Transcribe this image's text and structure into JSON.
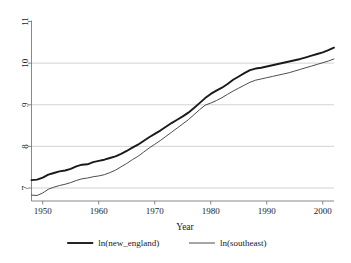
{
  "chart_data": {
    "type": "line",
    "title": "",
    "xlabel": "Year",
    "ylabel": "",
    "xlim": [
      1948,
      2002
    ],
    "ylim": [
      6.62,
      11.0
    ],
    "grid": true,
    "grid_axis": "y",
    "legend_position": "bottom",
    "xticks": [
      1950,
      1960,
      1970,
      1980,
      1990,
      2000
    ],
    "xtick_labels": [
      "1950",
      "1960",
      "1970",
      "1980",
      "1990",
      "2000"
    ],
    "yticks": [
      7,
      8,
      9,
      10,
      11
    ],
    "ytick_labels": [
      "7",
      "8",
      "9",
      "10",
      "11"
    ],
    "x": [
      1948,
      1949,
      1950,
      1951,
      1952,
      1953,
      1954,
      1955,
      1956,
      1957,
      1958,
      1959,
      1960,
      1961,
      1962,
      1963,
      1964,
      1965,
      1966,
      1967,
      1968,
      1969,
      1970,
      1971,
      1972,
      1973,
      1974,
      1975,
      1976,
      1977,
      1978,
      1979,
      1980,
      1981,
      1982,
      1983,
      1984,
      1985,
      1986,
      1987,
      1988,
      1989,
      1990,
      1991,
      1992,
      1993,
      1994,
      1995,
      1996,
      1997,
      1998,
      1999,
      2000,
      2001,
      2002
    ],
    "series": [
      {
        "name": "ln(new_england)",
        "color": "#1a1a1a",
        "width": 1.9,
        "values": [
          7.19,
          7.2,
          7.25,
          7.32,
          7.36,
          7.4,
          7.42,
          7.46,
          7.52,
          7.56,
          7.57,
          7.62,
          7.65,
          7.68,
          7.72,
          7.76,
          7.82,
          7.89,
          7.97,
          8.04,
          8.13,
          8.22,
          8.3,
          8.38,
          8.47,
          8.56,
          8.64,
          8.72,
          8.81,
          8.92,
          9.04,
          9.16,
          9.26,
          9.34,
          9.41,
          9.5,
          9.6,
          9.68,
          9.76,
          9.83,
          9.87,
          9.89,
          9.92,
          9.95,
          9.98,
          10.01,
          10.04,
          10.07,
          10.1,
          10.14,
          10.18,
          10.22,
          10.26,
          10.31,
          10.37
        ]
      },
      {
        "name": "ln(southeast)",
        "color": "#4d4d4d",
        "width": 1.0,
        "values": [
          6.83,
          6.82,
          6.88,
          6.97,
          7.02,
          7.06,
          7.09,
          7.13,
          7.18,
          7.22,
          7.24,
          7.27,
          7.29,
          7.32,
          7.37,
          7.43,
          7.51,
          7.59,
          7.68,
          7.76,
          7.86,
          7.96,
          8.05,
          8.14,
          8.24,
          8.34,
          8.44,
          8.54,
          8.64,
          8.76,
          8.88,
          8.99,
          9.04,
          9.1,
          9.17,
          9.25,
          9.33,
          9.4,
          9.47,
          9.54,
          9.59,
          9.62,
          9.65,
          9.68,
          9.71,
          9.74,
          9.77,
          9.81,
          9.85,
          9.89,
          9.93,
          9.97,
          10.01,
          10.05,
          10.1
        ]
      }
    ]
  },
  "legend": {
    "items": [
      {
        "label": "ln(new_england)",
        "style": "thick"
      },
      {
        "label": "ln(southeast)",
        "style": "thin"
      }
    ]
  },
  "axes": {
    "x_title": "Year"
  },
  "colors": {
    "background": "#ffffff",
    "grid": "#c8c8c8",
    "axis": "#7a7a7a",
    "text": "#1a1a1a"
  }
}
